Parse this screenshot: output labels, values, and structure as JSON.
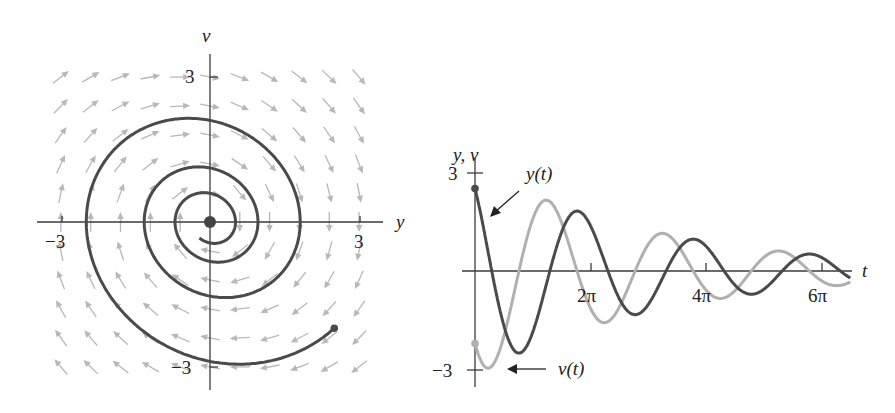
{
  "figure": {
    "model": {
      "equations": "dy/dt = v, dv/dt = -y - b*v",
      "damping_b": 0.2,
      "initial_y": 2.5,
      "initial_v": -2.2,
      "t_max": 20.4
    },
    "colors": {
      "y_curve": "#4a4a4a",
      "v_curve": "#b0b0b0",
      "axis": "#3a3a3a",
      "field": "#b8b8b8",
      "equilibrium": "#444444"
    }
  },
  "chart_data": [
    {
      "type": "line",
      "title": "Phase plane (direction field with solution curve)",
      "xlabel": "y",
      "ylabel": "v",
      "xlim": [
        -3.5,
        3.5
      ],
      "ylim": [
        -3.5,
        3.5
      ],
      "x_ticks": [
        {
          "value": -3,
          "label": "−3"
        },
        {
          "value": 3,
          "label": "3"
        }
      ],
      "y_ticks": [
        {
          "value": 3,
          "label": "3"
        },
        {
          "value": -3,
          "label": "−3"
        }
      ],
      "grid": false,
      "direction_field": {
        "spacing": 0.6,
        "range": [
          -3,
          3
        ],
        "arrow_color": "#b8b8b8"
      },
      "solution_start": {
        "y": 2.5,
        "v": -2.2
      },
      "equilibrium": {
        "y": 0,
        "v": 0
      },
      "notable_points": [
        {
          "desc": "top crossing of v-axis",
          "y": 0,
          "v": 2.1
        },
        {
          "desc": "left crossing of y-axis",
          "y": -2.47,
          "v": 0
        },
        {
          "desc": "bottom crossing of v-axis",
          "y": 0,
          "v": -2.96
        },
        {
          "desc": "right crossing of y-axis",
          "y": 1.81,
          "v": 0
        }
      ]
    },
    {
      "type": "line",
      "title": "Time series",
      "xlabel": "t",
      "ylabel": "y, v",
      "xlim": [
        0,
        20.4
      ],
      "ylim": [
        -3,
        3
      ],
      "x_ticks": [
        {
          "value": 6.283,
          "label": "2π"
        },
        {
          "value": 12.566,
          "label": "4π"
        },
        {
          "value": 18.85,
          "label": "6π"
        }
      ],
      "y_ticks": [
        {
          "value": 3,
          "label": "3"
        },
        {
          "value": -3,
          "label": "−3"
        }
      ],
      "grid": false,
      "series": [
        {
          "name": "y(t)",
          "color": "#4a4a4a",
          "start": 2.5,
          "extrema": [
            {
              "t": 0,
              "value": 2.5
            },
            {
              "t": 1.3,
              "value": -2.5
            },
            {
              "t": 5.0,
              "value": 1.82
            },
            {
              "t": 8.1,
              "value": -1.3
            },
            {
              "t": 11.7,
              "value": 0.97
            },
            {
              "t": 14.8,
              "value": -0.55
            },
            {
              "t": 18.0,
              "value": 0.5
            }
          ]
        },
        {
          "name": "v(t)",
          "color": "#b0b0b0",
          "start": -2.2,
          "extrema": [
            {
              "t": 0.3,
              "value": -3.0
            },
            {
              "t": 3.9,
              "value": 2.15
            },
            {
              "t": 7.1,
              "value": -1.55
            },
            {
              "t": 10.2,
              "value": 1.18
            },
            {
              "t": 13.4,
              "value": -0.8
            },
            {
              "t": 16.6,
              "value": 0.85
            }
          ]
        }
      ],
      "annotations": [
        {
          "text": "y(t)",
          "points_to": "y(t) curve near t=0"
        },
        {
          "text": "v(t)",
          "points_to": "v(t) curve minimum near t=0"
        }
      ]
    }
  ],
  "labels": {
    "left": {
      "x_axis": "y",
      "y_axis": "v",
      "x_tick_neg": "−3",
      "x_tick_pos": "3",
      "y_tick_pos": "3",
      "y_tick_neg": "−3"
    },
    "right": {
      "y_axis": "y, v",
      "t_axis": "t",
      "y_tick_pos": "3",
      "y_tick_neg": "−3",
      "t_tick_1": "2π",
      "t_tick_2": "4π",
      "t_tick_3": "6π",
      "y_annotation": "y(t)",
      "v_annotation": "v(t)"
    }
  }
}
